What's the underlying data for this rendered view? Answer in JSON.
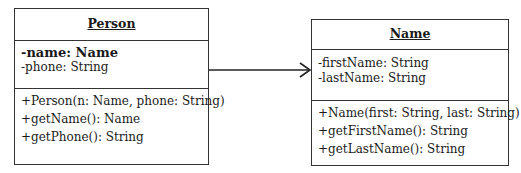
{
  "classes": {
    "person": {
      "name": "Person",
      "attributes": [
        "-name: Name",
        "-phone: String"
      ],
      "operations": [
        "+Person(n: Name, phone: String)",
        "+getName(): Name",
        "+getPhone(): String"
      ]
    },
    "name": {
      "name": "Name",
      "attributes": [
        "-firstName: String",
        "-lastName: String"
      ],
      "operations": [
        "+Name(first: String, last: String)",
        "+getFirstName(): String",
        "+getLastName(): String"
      ]
    }
  },
  "relationships": [
    {
      "type": "directed-association",
      "from": "Person",
      "to": "Name"
    }
  ],
  "colors": {
    "line": "#333333",
    "text": "#1a1a1a",
    "background": "#ffffff"
  }
}
